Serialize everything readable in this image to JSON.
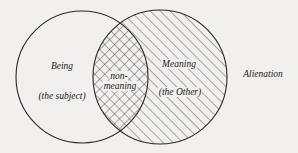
{
  "diagram": {
    "title": "Alienation",
    "left_set": {
      "name": "Being",
      "subtitle": "(the subject)"
    },
    "right_set": {
      "name": "Meaning",
      "subtitle": "(the Other)"
    },
    "intersection": {
      "line1": "non-",
      "line2": "meaning"
    },
    "colors": {
      "background": "#f1f0ee",
      "ink": "#2a2a2a"
    }
  }
}
